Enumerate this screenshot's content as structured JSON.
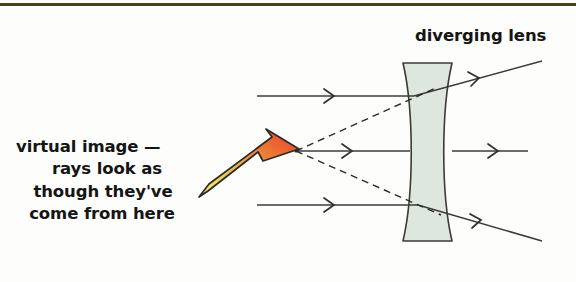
{
  "figure": {
    "border_color": "#44421f",
    "background": "#fdfdfb"
  },
  "labels": {
    "lens_label": "diverging lens",
    "virtual_image_lines": [
      "virtual image —",
      "rays look as",
      "though they've",
      "come from here"
    ]
  },
  "colors": {
    "lens_fill": "#dde7dd",
    "lens_stroke": "#3a3a3a",
    "ray_stroke": "#3b3b3b",
    "dashed_stroke": "#2b2b2b",
    "arrow_tail": "#f5e35c",
    "arrow_head": "#e8412a",
    "arrow_outline": "#2a2a2a",
    "text": "#151515"
  },
  "diagram": {
    "lens": {
      "name": "diverging-lens",
      "type": "biconcave",
      "top_y": 63,
      "bottom_y": 241,
      "left_x": 403,
      "right_x": 452,
      "waist_inset": 12
    },
    "virtual_focus": {
      "x": 295,
      "y": 151
    },
    "incoming_rays": [
      {
        "name": "incoming-ray-top",
        "x1": 257,
        "y1": 96,
        "x2": 414,
        "y2": 96,
        "marker_x": 330
      },
      {
        "name": "incoming-ray-middle",
        "x1": 297,
        "y1": 151,
        "x2": 410,
        "y2": 151,
        "marker_x": 348
      },
      {
        "name": "incoming-ray-bottom",
        "x1": 257,
        "y1": 205,
        "x2": 418,
        "y2": 205,
        "marker_x": 330
      }
    ],
    "outgoing_rays": [
      {
        "name": "outgoing-ray-top",
        "x1": 414,
        "y1": 96,
        "x2": 540,
        "y2": 62,
        "marker_t": 0.48
      },
      {
        "name": "outgoing-ray-middle",
        "x1": 452,
        "y1": 151,
        "x2": 528,
        "y2": 151,
        "marker_t": 0.45
      },
      {
        "name": "outgoing-ray-bottom",
        "x1": 418,
        "y1": 205,
        "x2": 540,
        "y2": 240,
        "marker_t": 0.46
      }
    ],
    "virtual_rays_dashed": [
      {
        "name": "virtual-ray-dashed-upper",
        "x1": 295,
        "y1": 151,
        "x2": 437,
        "y2": 87
      },
      {
        "name": "virtual-ray-dashed-lower",
        "x1": 295,
        "y1": 151,
        "x2": 440,
        "y2": 214
      }
    ],
    "pointer_arrow": {
      "name": "virtual-image-pointer-arrow",
      "tail_x": 200,
      "tail_y": 190,
      "tip_x": 297,
      "tip_y": 150
    }
  }
}
